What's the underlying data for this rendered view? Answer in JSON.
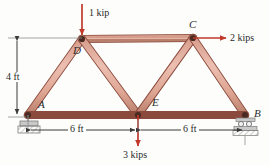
{
  "figure": {
    "type": "truss-free-body-diagram"
  },
  "colors": {
    "member_fill": "#e0a898",
    "member_edge": "#8a4a3c",
    "load_arrow": "#c0392b",
    "dimension_line": "#4a4a4a",
    "support": "#b8b8b8",
    "text": "#2b2b2b",
    "background": "#fdfdfb"
  },
  "nodes": [
    {
      "id": "A",
      "label": "A",
      "x": 28,
      "y": 115,
      "label_x": 38,
      "label_y": 100
    },
    {
      "id": "D",
      "label": "D",
      "x": 82,
      "y": 39,
      "label_x": 74,
      "label_y": 47
    },
    {
      "id": "C",
      "label": "C",
      "x": 193,
      "y": 38,
      "label_x": 190,
      "label_y": 20
    },
    {
      "id": "E",
      "label": "E",
      "x": 138,
      "y": 115,
      "label_x": 152,
      "label_y": 99
    },
    {
      "id": "B",
      "label": "B",
      "x": 245,
      "y": 115,
      "label_x": 255,
      "label_y": 108
    }
  ],
  "members": [
    {
      "from": "A",
      "to": "D"
    },
    {
      "from": "D",
      "to": "C"
    },
    {
      "from": "D",
      "to": "E"
    },
    {
      "from": "C",
      "to": "E"
    },
    {
      "from": "C",
      "to": "B"
    },
    {
      "from": "A",
      "to": "E"
    },
    {
      "from": "E",
      "to": "B"
    }
  ],
  "loads": [
    {
      "id": "load-d",
      "label": "1 kip",
      "magnitude": 1,
      "unit": "kip",
      "direction": "down",
      "at_node": "D",
      "label_x": 90,
      "label_y": 8
    },
    {
      "id": "load-c",
      "label": "2 kips",
      "magnitude": 2,
      "unit": "kips",
      "direction": "right",
      "at_node": "C",
      "label_x": 231,
      "label_y": 33
    },
    {
      "id": "load-e",
      "label": "3 kips",
      "magnitude": 3,
      "unit": "kips",
      "direction": "down",
      "at_node": "E",
      "label_x": 124,
      "label_y": 150
    }
  ],
  "dimensions": [
    {
      "id": "height",
      "label": "4 ft",
      "value": 4,
      "unit": "ft",
      "orientation": "vertical",
      "label_x": 4,
      "label_y": 72
    },
    {
      "id": "span-left",
      "label": "6 ft",
      "value": 6,
      "unit": "ft",
      "orientation": "horizontal",
      "label_x": 68,
      "label_y": 133
    },
    {
      "id": "span-right",
      "label": "6 ft",
      "value": 6,
      "unit": "ft",
      "orientation": "horizontal",
      "label_x": 182,
      "label_y": 133
    }
  ],
  "supports": [
    {
      "id": "support-a",
      "at_node": "A",
      "kind": "pin"
    },
    {
      "id": "support-b",
      "at_node": "B",
      "kind": "roller"
    }
  ]
}
